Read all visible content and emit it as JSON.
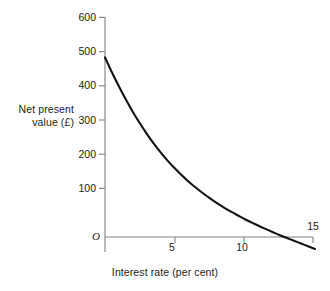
{
  "chart_data": {
    "type": "line",
    "title": "",
    "xlabel": "Interest rate (per cent)",
    "ylabel": "Net present value (£)",
    "ylabel_line1": "Net present",
    "ylabel_line2": "value (£)",
    "origin_label": "O",
    "xlim": [
      0,
      15
    ],
    "ylim": [
      -50,
      600
    ],
    "xticks": [
      5,
      10,
      15
    ],
    "xtick_labels": [
      "5",
      "10",
      "15"
    ],
    "yticks": [
      100,
      200,
      300,
      400,
      500,
      600
    ],
    "ytick_labels": [
      "100",
      "200",
      "300",
      "400",
      "500",
      "600"
    ],
    "grid": false,
    "legend": null,
    "line_color": "#111111",
    "axis_color": "#777777",
    "background": "#ffffff",
    "zero_crossing_x": 11.9,
    "x": [
      0,
      0.5,
      1,
      1.5,
      2,
      2.5,
      3,
      3.5,
      4,
      4.5,
      5,
      5.5,
      6,
      6.5,
      7,
      7.5,
      8,
      8.5,
      9,
      9.5,
      10,
      10.5,
      11,
      11.5,
      12,
      12.5,
      13,
      13.5,
      14,
      14.5,
      15
    ],
    "values": [
      525,
      481,
      440,
      401,
      365,
      332,
      301,
      272,
      246,
      222,
      200,
      180,
      161,
      144,
      128,
      113,
      99,
      86,
      74,
      63,
      52,
      42,
      32,
      23,
      14,
      5,
      -3,
      -11,
      -19,
      -27,
      -35
    ],
    "series": [
      {
        "name": "Net present value",
        "values": [
          525,
          481,
          440,
          401,
          365,
          332,
          301,
          272,
          246,
          222,
          200,
          180,
          161,
          144,
          128,
          113,
          99,
          86,
          74,
          63,
          52,
          42,
          32,
          23,
          14,
          5,
          -3,
          -11,
          -19,
          -27,
          -35
        ]
      }
    ]
  },
  "geometry": {
    "origin_px": [
      105,
      237
    ],
    "x_px_per_unit": 14,
    "y_px_per_100": 34.2
  }
}
